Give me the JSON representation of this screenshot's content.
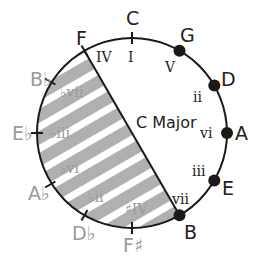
{
  "title": "C Major",
  "colors": {
    "in_key": "#222222",
    "out_of_key": "#9a9a9a",
    "shade": "#b0b0b0",
    "line": "#1a1a1a"
  },
  "notes": [
    {
      "note": "C",
      "degree": "I",
      "in_key": true,
      "marker": "tick"
    },
    {
      "note": "G",
      "degree": "V",
      "in_key": true,
      "marker": "dot"
    },
    {
      "note": "D",
      "degree": "ii",
      "in_key": true,
      "marker": "dot"
    },
    {
      "note": "A",
      "degree": "vi",
      "in_key": true,
      "marker": "dot"
    },
    {
      "note": "E",
      "degree": "iii",
      "in_key": true,
      "marker": "dot"
    },
    {
      "note": "B",
      "degree": "vii",
      "in_key": true,
      "marker": "dot"
    },
    {
      "note": "F♯",
      "degree": "♯IV",
      "in_key": false,
      "marker": "tick"
    },
    {
      "note": "D♭",
      "degree": "♭ii",
      "in_key": false,
      "marker": "tick"
    },
    {
      "note": "A♭",
      "degree": "♭vi",
      "in_key": false,
      "marker": "tick"
    },
    {
      "note": "E♭",
      "degree": "♭iii",
      "in_key": false,
      "marker": "tick"
    },
    {
      "note": "B♭",
      "degree": "♭vii",
      "in_key": false,
      "marker": "tick"
    },
    {
      "note": "F",
      "degree": "IV",
      "in_key": true,
      "marker": "tick"
    }
  ],
  "shaded_region": {
    "from": "F",
    "to": "B",
    "pattern": "diagonal-stripes"
  }
}
